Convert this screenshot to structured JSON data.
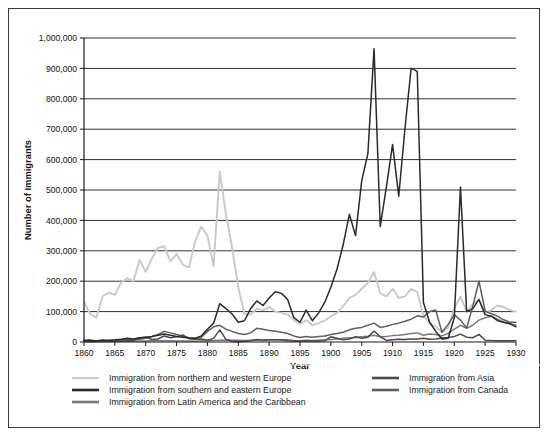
{
  "chart_data": {
    "type": "line",
    "title": "",
    "xlabel": "Year",
    "ylabel": "Number of Immigrants",
    "xlim": [
      1860,
      1930
    ],
    "ylim": [
      0,
      1000000
    ],
    "xticks": [
      1860,
      1865,
      1870,
      1875,
      1880,
      1885,
      1890,
      1895,
      1900,
      1905,
      1910,
      1915,
      1920,
      1925,
      1930
    ],
    "xtick_labels": [
      "1860",
      "1865",
      "1870",
      "1875",
      "1880",
      "1885",
      "1890",
      "1895",
      "1900",
      "1905",
      "1910",
      "1915",
      "1920",
      "1925",
      "1930"
    ],
    "yticks": [
      0,
      100000,
      200000,
      300000,
      400000,
      500000,
      600000,
      700000,
      800000,
      900000,
      1000000
    ],
    "ytick_labels": [
      "0",
      "100,000",
      "200,000",
      "300,000",
      "400,000",
      "500,000",
      "600,000",
      "700,000",
      "800,000",
      "900,000",
      "1,000,000"
    ],
    "grid": true,
    "legend_position": "bottom",
    "x": [
      1860,
      1861,
      1862,
      1863,
      1864,
      1865,
      1866,
      1867,
      1868,
      1869,
      1870,
      1871,
      1872,
      1873,
      1874,
      1875,
      1876,
      1877,
      1878,
      1879,
      1880,
      1881,
      1882,
      1883,
      1884,
      1885,
      1886,
      1887,
      1888,
      1889,
      1890,
      1891,
      1892,
      1893,
      1894,
      1895,
      1896,
      1897,
      1898,
      1899,
      1900,
      1901,
      1902,
      1903,
      1904,
      1905,
      1906,
      1907,
      1908,
      1909,
      1910,
      1911,
      1912,
      1913,
      1914,
      1915,
      1916,
      1917,
      1918,
      1919,
      1920,
      1921,
      1922,
      1923,
      1924,
      1925,
      1926,
      1927,
      1928,
      1929,
      1930
    ],
    "series": [
      {
        "name": "Immigration from northern and western Europe",
        "color": "#c9c9c9",
        "values": [
          132000,
          92000,
          80000,
          150000,
          162000,
          155000,
          195000,
          210000,
          200000,
          270000,
          230000,
          275000,
          310000,
          315000,
          265000,
          290000,
          255000,
          245000,
          330000,
          380000,
          350000,
          250000,
          560000,
          420000,
          310000,
          180000,
          92000,
          90000,
          110000,
          105000,
          115000,
          100000,
          96000,
          90000,
          72000,
          60000,
          72000,
          55000,
          62000,
          70000,
          85000,
          96000,
          118000,
          145000,
          155000,
          175000,
          195000,
          230000,
          160000,
          150000,
          175000,
          145000,
          150000,
          175000,
          165000,
          86000,
          62000,
          50000,
          32000,
          48000,
          110000,
          150000,
          100000,
          125000,
          138000,
          95000,
          105000,
          120000,
          115000,
          105000,
          100000
        ]
      },
      {
        "name": "Immigration from southern and eastern Europe",
        "color": "#2a2a2a",
        "values": [
          5000,
          4000,
          4000,
          5000,
          6000,
          7000,
          9000,
          12000,
          10000,
          14000,
          16000,
          18000,
          22000,
          26000,
          22000,
          18000,
          16000,
          13000,
          12000,
          20000,
          42000,
          62000,
          126000,
          110000,
          92000,
          65000,
          70000,
          110000,
          135000,
          120000,
          145000,
          165000,
          160000,
          140000,
          80000,
          65000,
          105000,
          70000,
          95000,
          130000,
          180000,
          240000,
          320000,
          420000,
          350000,
          530000,
          620000,
          965000,
          380000,
          510000,
          650000,
          480000,
          700000,
          900000,
          890000,
          130000,
          65000,
          35000,
          10000,
          12000,
          80000,
          510000,
          100000,
          110000,
          140000,
          90000,
          85000,
          70000,
          65000,
          60000,
          50000
        ]
      },
      {
        "name": "Immigration from Latin America and the Caribbean",
        "color": "#7a7a7a",
        "values": [
          1500,
          1200,
          1200,
          1500,
          1800,
          2000,
          2500,
          3000,
          2800,
          3200,
          3500,
          3800,
          4200,
          4500,
          4000,
          3500,
          3200,
          3000,
          2800,
          3200,
          4000,
          5000,
          6000,
          6500,
          6000,
          5500,
          5000,
          6000,
          6500,
          6000,
          6500,
          7000,
          7500,
          7000,
          5000,
          4500,
          5500,
          5000,
          6000,
          7000,
          8000,
          10000,
          12000,
          14000,
          15000,
          17000,
          19000,
          22000,
          17000,
          18000,
          21000,
          22000,
          25000,
          28000,
          30000,
          22000,
          26000,
          25000,
          20000,
          28000,
          42000,
          55000,
          45000,
          55000,
          72000,
          80000,
          85000,
          75000,
          65000,
          60000,
          55000
        ]
      },
      {
        "name": "Immigration from Asia",
        "color": "#4a4a4a",
        "values": [
          5000,
          7000,
          3500,
          7000,
          3000,
          2500,
          3000,
          4000,
          5500,
          13000,
          16000,
          8000,
          10000,
          20000,
          14000,
          17000,
          23000,
          11000,
          9000,
          10000,
          6000,
          12000,
          40000,
          8500,
          2500,
          1000,
          2500,
          4000,
          8000,
          6000,
          7000,
          7500,
          6500,
          4000,
          3500,
          3500,
          4000,
          3000,
          3500,
          4000,
          17000,
          12000,
          7000,
          10000,
          17000,
          12000,
          16000,
          36000,
          18000,
          5000,
          7000,
          9000,
          8000,
          10000,
          10000,
          12000,
          9000,
          10000,
          13000,
          15000,
          18000,
          26000,
          16000,
          14000,
          25000,
          6000,
          5000,
          4500,
          4000,
          4500,
          4000
        ]
      },
      {
        "name": "Immigration from Canada",
        "color": "#5e5e5e",
        "values": [
          2000,
          2000,
          2500,
          3500,
          4000,
          5000,
          6500,
          8000,
          7000,
          9000,
          12000,
          18000,
          25000,
          35000,
          30000,
          25000,
          18000,
          14000,
          12000,
          16000,
          35000,
          50000,
          55000,
          42000,
          35000,
          28000,
          25000,
          30000,
          45000,
          42000,
          38000,
          35000,
          32000,
          28000,
          20000,
          15000,
          18000,
          16000,
          18000,
          20000,
          25000,
          28000,
          32000,
          40000,
          45000,
          48000,
          55000,
          62000,
          48000,
          52000,
          58000,
          62000,
          68000,
          75000,
          86000,
          82000,
          100000,
          105000,
          32000,
          58000,
          90000,
          72000,
          46000,
          118000,
          200000,
          102000,
          93000,
          85000,
          73000,
          65000,
          65000
        ]
      }
    ],
    "legend": [
      {
        "label": "Immigration from northern and western Europe",
        "color": "#c9c9c9",
        "column": 0
      },
      {
        "label": "Immigration from southern and eastern Europe",
        "color": "#2a2a2a",
        "column": 0
      },
      {
        "label": "Immigration from Latin America and the Caribbean",
        "color": "#7a7a7a",
        "column": 0
      },
      {
        "label": "Immigration from Asia",
        "color": "#4a4a4a",
        "column": 1
      },
      {
        "label": "Immigration from Canada",
        "color": "#5e5e5e",
        "column": 1
      }
    ]
  }
}
